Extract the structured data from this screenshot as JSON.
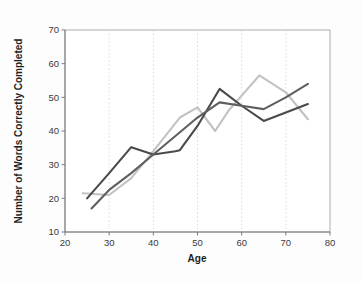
{
  "chart_data": {
    "type": "line",
    "title": "",
    "xlabel": "Age",
    "ylabel": "Number of Words Correctly Completed",
    "xlim": [
      20,
      80
    ],
    "ylim": [
      10,
      70
    ],
    "xticks": [
      20,
      30,
      40,
      50,
      60,
      70,
      80
    ],
    "yticks": [
      10,
      20,
      30,
      40,
      50,
      60,
      70
    ],
    "grid": "vertical-dotted",
    "legend": "none",
    "series": [
      {
        "name": "series-dark",
        "color": "#4a4a4a",
        "x": [
          25,
          30,
          35,
          40,
          45,
          46,
          50,
          55,
          60,
          65,
          70,
          75
        ],
        "y": [
          20.0,
          27.5,
          35.2,
          33.0,
          34.0,
          34.3,
          41.5,
          52.5,
          47.5,
          43.0,
          45.5,
          48.0
        ]
      },
      {
        "name": "series-medium",
        "color": "#5f5f5f",
        "x": [
          26,
          30,
          35,
          40,
          45,
          50,
          55,
          60,
          65,
          70,
          75
        ],
        "y": [
          17.0,
          22.5,
          27.5,
          33.0,
          38.5,
          44.0,
          48.5,
          47.5,
          46.5,
          50.0,
          54.0
        ]
      },
      {
        "name": "series-light",
        "color": "#c2c2c2",
        "x": [
          24,
          30,
          35,
          40,
          46,
          50,
          54,
          57,
          60,
          64,
          70,
          75
        ],
        "y": [
          21.5,
          21.0,
          26.0,
          34.0,
          44.0,
          47.0,
          40.0,
          46.0,
          50.5,
          56.5,
          51.5,
          43.5
        ]
      }
    ]
  },
  "axes": {
    "x_title": "Age",
    "y_title": "Number of Words Correctly Completed",
    "x_tick_labels": [
      "20",
      "30",
      "40",
      "50",
      "60",
      "70",
      "80"
    ],
    "y_tick_labels": [
      "10",
      "20",
      "30",
      "40",
      "50",
      "60",
      "70"
    ]
  },
  "colors": {
    "background": "#fdfdfd",
    "plot_background": "#ffffff",
    "grid": "#cfcfcf",
    "axis": "#6f6f6f",
    "border": "#9a9a9a",
    "series_dark": "#4a4a4a",
    "series_medium": "#5f5f5f",
    "series_light": "#c2c2c2"
  }
}
